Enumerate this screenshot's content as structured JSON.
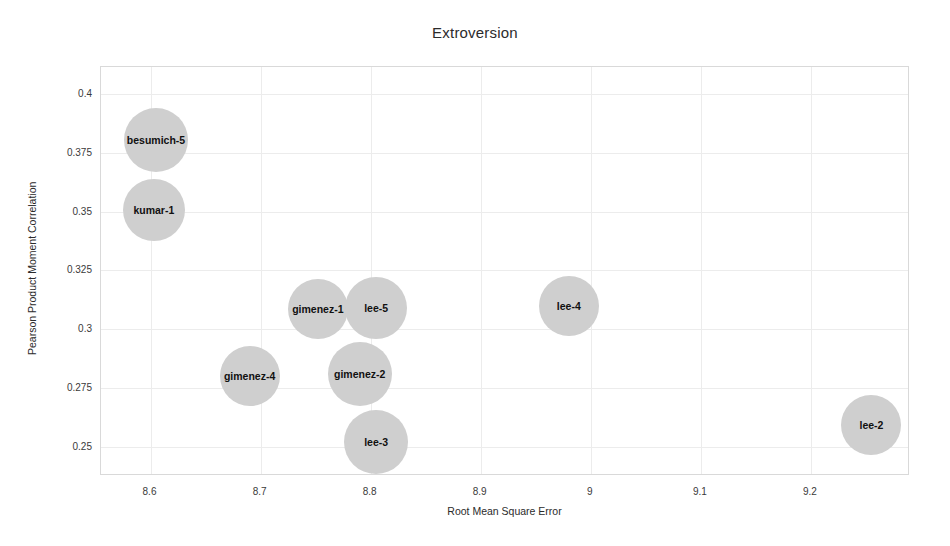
{
  "chart_data": {
    "type": "scatter",
    "title": "Extroversion",
    "xlabel": "Root Mean Square Error",
    "ylabel": "Pearson Product Moment Correlation",
    "xlim": [
      8.555,
      9.29
    ],
    "ylim": [
      0.2375,
      0.4115
    ],
    "grid": true,
    "legend": null,
    "xticks": [
      "8.6",
      "8.7",
      "8.8",
      "8.9",
      "9",
      "9.1",
      "9.2"
    ],
    "xtick_values": [
      8.6,
      8.7,
      8.8,
      8.9,
      9.0,
      9.1,
      9.2
    ],
    "yticks": [
      "0.4",
      "0.375",
      "0.35",
      "0.325",
      "0.3",
      "0.275",
      "0.25"
    ],
    "ytick_values": [
      0.4,
      0.375,
      0.35,
      0.325,
      0.3,
      0.275,
      0.25
    ],
    "bubble_color": "#cfcfcf",
    "points": [
      {
        "label": "besumich-5",
        "x": 8.605,
        "y": 0.3805,
        "r": 32
      },
      {
        "label": "kumar-1",
        "x": 8.603,
        "y": 0.3505,
        "r": 31
      },
      {
        "label": "gimenez-1",
        "x": 8.752,
        "y": 0.3085,
        "r": 30
      },
      {
        "label": "lee-5",
        "x": 8.805,
        "y": 0.309,
        "r": 31
      },
      {
        "label": "gimenez-4",
        "x": 8.69,
        "y": 0.28,
        "r": 30
      },
      {
        "label": "gimenez-2",
        "x": 8.79,
        "y": 0.281,
        "r": 32
      },
      {
        "label": "lee-3",
        "x": 8.805,
        "y": 0.252,
        "r": 32
      },
      {
        "label": "lee-4",
        "x": 8.98,
        "y": 0.31,
        "r": 30
      },
      {
        "label": "lee-2",
        "x": 9.255,
        "y": 0.259,
        "r": 30
      }
    ]
  }
}
